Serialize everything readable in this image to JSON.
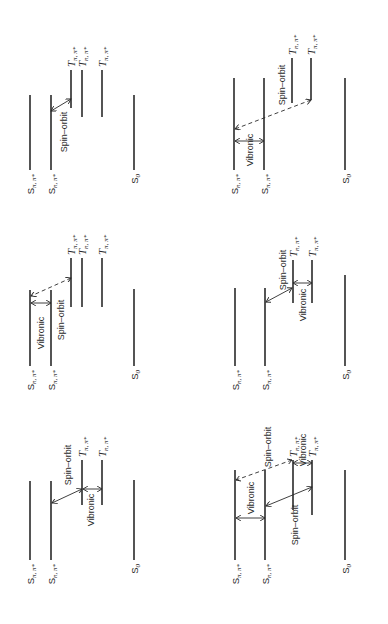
{
  "figure": {
    "colors": {
      "line": "#2a2a2a",
      "background": "#ffffff"
    }
  },
  "labels": {
    "S_pipi": "S",
    "S_npi": "S",
    "T": "T",
    "sub_pipi": "π, π*",
    "sub_npi": "n, π*",
    "S0": "S",
    "S0_sub": "0",
    "spin_orbit": "Spin–orbit",
    "vibronic": "Vibronic"
  },
  "panels": [
    {
      "id": "top-left",
      "levels": [
        {
          "state": "S",
          "sub": "π, π*",
          "x": 30,
          "y1": 95,
          "y2": 170
        },
        {
          "state": "S",
          "sub": "n, π*",
          "x": 51,
          "y1": 95,
          "y2": 170
        },
        {
          "state": "T",
          "sub": "π, π*",
          "x": 71,
          "y1": 70,
          "y2": 108
        },
        {
          "state": "T",
          "sub": "n, π*",
          "x": 82,
          "y1": 70,
          "y2": 117
        },
        {
          "state": "T",
          "sub": "π, π*",
          "x": 102,
          "y1": 70,
          "y2": 117
        },
        {
          "state": "S",
          "sub": "0",
          "x": 134,
          "y1": 95,
          "y2": 170
        }
      ],
      "couplings": [
        {
          "type": "Spin–orbit",
          "style": "solid",
          "from": [
            51,
            111
          ],
          "to": [
            71,
            99
          ],
          "label_pos": [
            67,
            132
          ]
        }
      ]
    },
    {
      "id": "top-right",
      "levels": [
        {
          "state": "S",
          "sub": "n, π*",
          "x": 234,
          "y1": 78,
          "y2": 170
        },
        {
          "state": "S",
          "sub": "π, π*",
          "x": 264,
          "y1": 78,
          "y2": 170
        },
        {
          "state": "T",
          "sub": "n, π*",
          "x": 292,
          "y1": 58,
          "y2": 103
        },
        {
          "state": "T",
          "sub": "π, π*",
          "x": 311,
          "y1": 58,
          "y2": 100
        },
        {
          "state": "S",
          "sub": "0",
          "x": 345,
          "y1": 78,
          "y2": 170
        }
      ],
      "couplings": [
        {
          "type": "Spin–orbit",
          "style": "dashed",
          "from": [
            311,
            100
          ],
          "to": [
            235,
            129
          ],
          "label_pos": [
            285,
            85
          ]
        },
        {
          "type": "Vibronic",
          "style": "solid",
          "from": [
            235,
            141
          ],
          "to": [
            264,
            141
          ],
          "label_pos": [
            253,
            150
          ]
        }
      ]
    },
    {
      "id": "middle-left",
      "levels": [
        {
          "state": "S",
          "sub": "n, π*",
          "x": 30,
          "y1": 290,
          "y2": 366
        },
        {
          "state": "S",
          "sub": "π, π*",
          "x": 51,
          "y1": 290,
          "y2": 366
        },
        {
          "state": "T",
          "sub": "π, π*",
          "x": 71,
          "y1": 258,
          "y2": 307
        },
        {
          "state": "T",
          "sub": "n, π*",
          "x": 82,
          "y1": 258,
          "y2": 307
        },
        {
          "state": "T",
          "sub": "π, π*",
          "x": 102,
          "y1": 258,
          "y2": 307
        },
        {
          "state": "S",
          "sub": "0",
          "x": 134,
          "y1": 289,
          "y2": 366
        }
      ],
      "couplings": [
        {
          "type": "Spin–orbit",
          "style": "dashed",
          "from": [
            71,
            278
          ],
          "to": [
            31,
            296
          ],
          "label_pos": [
            64,
            320
          ]
        },
        {
          "type": "Vibronic",
          "style": "solid",
          "from": [
            31,
            303
          ],
          "to": [
            51,
            303
          ],
          "label_pos": [
            44,
            333
          ]
        }
      ]
    },
    {
      "id": "middle-right",
      "levels": [
        {
          "state": "S",
          "sub": "n, π*",
          "x": 235,
          "y1": 288,
          "y2": 366
        },
        {
          "state": "S",
          "sub": "π, π*",
          "x": 265,
          "y1": 288,
          "y2": 366
        },
        {
          "state": "T",
          "sub": "n, π*",
          "x": 293,
          "y1": 260,
          "y2": 303
        },
        {
          "state": "T",
          "sub": "π, π*",
          "x": 312,
          "y1": 260,
          "y2": 303
        },
        {
          "state": "S",
          "sub": "0",
          "x": 345,
          "y1": 275,
          "y2": 366
        }
      ],
      "couplings": [
        {
          "type": "Spin–orbit",
          "style": "solid",
          "from": [
            292,
            288
          ],
          "to": [
            266,
            302
          ],
          "label_pos": [
            286,
            270
          ]
        },
        {
          "type": "Vibronic",
          "style": "solid",
          "from": [
            293,
            283
          ],
          "to": [
            312,
            283
          ],
          "label_pos": [
            306,
            305
          ]
        }
      ]
    },
    {
      "id": "bottom-left",
      "levels": [
        {
          "state": "S",
          "sub": "π, π*",
          "x": 30,
          "y1": 481,
          "y2": 560
        },
        {
          "state": "S",
          "sub": "n, π*",
          "x": 51,
          "y1": 481,
          "y2": 560
        },
        {
          "state": "T",
          "sub": "π, π*",
          "x": 82,
          "y1": 460,
          "y2": 505
        },
        {
          "state": "T",
          "sub": "n, π*",
          "x": 102,
          "y1": 460,
          "y2": 505
        },
        {
          "state": "S",
          "sub": "0",
          "x": 134,
          "y1": 480,
          "y2": 560
        }
      ],
      "couplings": [
        {
          "type": "Spin–orbit",
          "style": "solid",
          "from": [
            82,
            489
          ],
          "to": [
            52,
            503
          ],
          "label_pos": [
            71,
            465
          ]
        },
        {
          "type": "Vibronic",
          "style": "solid",
          "from": [
            83,
            489
          ],
          "to": [
            102,
            489
          ],
          "label_pos": [
            94,
            510
          ]
        }
      ]
    },
    {
      "id": "bottom-right",
      "levels": [
        {
          "state": "S",
          "sub": "π, π*",
          "x": 235,
          "y1": 470,
          "y2": 560
        },
        {
          "state": "S",
          "sub": "n, π*",
          "x": 265,
          "y1": 470,
          "y2": 560
        },
        {
          "state": "T",
          "sub": "n, π*",
          "x": 293,
          "y1": 460,
          "y2": 510
        },
        {
          "state": "T",
          "sub": "π, π*",
          "x": 312,
          "y1": 460,
          "y2": 515
        },
        {
          "state": "S",
          "sub": "0",
          "x": 345,
          "y1": 470,
          "y2": 560
        }
      ],
      "couplings": [
        {
          "type": "Spin–orbit",
          "style": "dashed",
          "from": [
            292,
            460
          ],
          "to": [
            236,
            480
          ],
          "label_pos": [
            271,
            447
          ]
        },
        {
          "type": "Spin–orbit",
          "style": "solid",
          "from": [
            312,
            487
          ],
          "to": [
            266,
            506
          ],
          "label_pos": [
            298,
            525
          ]
        },
        {
          "type": "Vibronic",
          "style": "solid",
          "from": [
            236,
            518
          ],
          "to": [
            265,
            518
          ],
          "label_pos": [
            254,
            498
          ]
        },
        {
          "type": "Vibronic",
          "style": "solid",
          "from": [
            293,
            463
          ],
          "to": [
            312,
            463
          ],
          "label_pos": [
            306,
            450
          ]
        }
      ]
    }
  ]
}
